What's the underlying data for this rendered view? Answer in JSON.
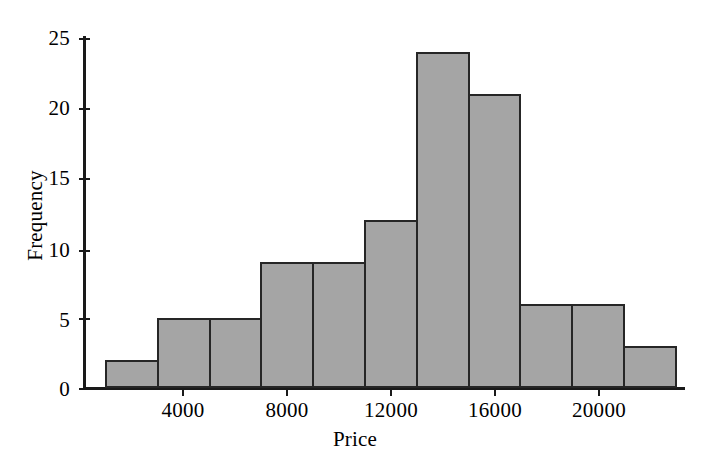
{
  "chart_data": {
    "type": "bar",
    "title": "",
    "xlabel": "Price",
    "ylabel": "Frequency",
    "categories": [
      "1000-3000",
      "3000-5000",
      "5000-7000",
      "7000-9000",
      "9000-11000",
      "11000-13000",
      "13000-15000",
      "15000-17000",
      "17000-19000",
      "19000-21000",
      "21000-23000"
    ],
    "bin_edges": [
      1000,
      3000,
      5000,
      7000,
      9000,
      11000,
      13000,
      15000,
      17000,
      19000,
      21000,
      23000
    ],
    "bin_width": 2000,
    "values": [
      2,
      5,
      5,
      9,
      9,
      12,
      24,
      21,
      6,
      6,
      3
    ],
    "xlim": [
      700,
      23300
    ],
    "ylim": [
      0,
      25
    ],
    "xticks": [
      4000,
      8000,
      12000,
      16000,
      20000
    ],
    "xtick_labels": [
      "4000",
      "8000",
      "12000",
      "16000",
      "20000"
    ],
    "yticks": [
      0,
      5,
      10,
      15,
      20,
      25
    ],
    "ytick_labels": [
      "0",
      "5",
      "10",
      "15",
      "20",
      "25"
    ],
    "grid": false,
    "legend": false,
    "bar_fill_color": "#a5a5a5",
    "bar_edge_color": "#262626",
    "axis_color": "#1a1a1a",
    "background_color": "#ffffff"
  }
}
